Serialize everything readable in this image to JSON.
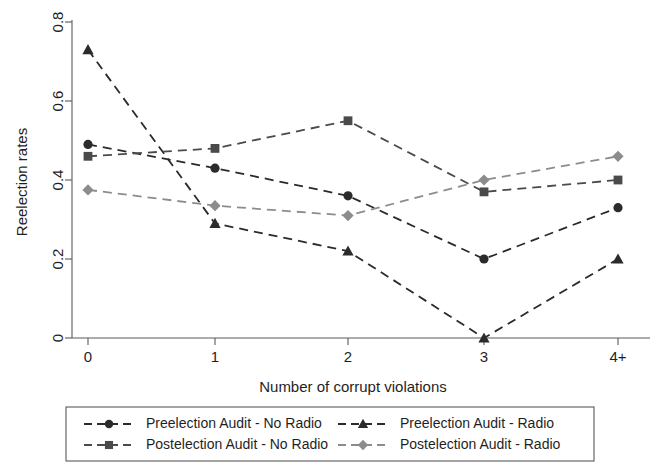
{
  "chart_data": {
    "type": "line",
    "title": "",
    "xlabel": "Number of corrupt violations",
    "ylabel": "Reelection rates",
    "categories": [
      "0",
      "1",
      "2",
      "3",
      "4+"
    ],
    "x_tick_labels": [
      "0",
      "1",
      "2",
      "3",
      "4+"
    ],
    "y_tick_labels": [
      "0",
      "0.2",
      "0.4",
      "0.6",
      "0.8"
    ],
    "y_tick_values": [
      0,
      0.2,
      0.4,
      0.6,
      0.8
    ],
    "ylim": [
      0,
      0.8
    ],
    "grid": false,
    "legend_position": "bottom",
    "series": [
      {
        "name": "Preelection Audit - No Radio",
        "marker": "circle",
        "color": "#2b2b2b",
        "values": [
          0.49,
          0.43,
          0.36,
          0.2,
          0.33
        ]
      },
      {
        "name": "Preelection Audit - Radio",
        "marker": "triangle",
        "color": "#2b2b2b",
        "values": [
          0.73,
          0.29,
          0.22,
          0.0,
          0.2
        ]
      },
      {
        "name": "Postelection Audit - No Radio",
        "marker": "square",
        "color": "#4a4a4a",
        "values": [
          0.46,
          0.48,
          0.55,
          0.37,
          0.4
        ]
      },
      {
        "name": "Postelection Audit - Radio",
        "marker": "diamond",
        "color": "#8c8c8c",
        "values": [
          0.375,
          0.335,
          0.31,
          0.4,
          0.46
        ]
      }
    ]
  }
}
